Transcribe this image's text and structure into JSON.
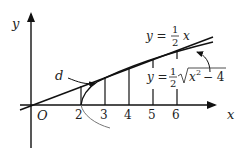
{
  "diagram": {
    "axes": {
      "x_label": "x",
      "y_label": "y",
      "origin_label": "O"
    },
    "ticks": [
      {
        "value": 2,
        "label": "2"
      },
      {
        "value": 3,
        "label": "3"
      },
      {
        "value": 4,
        "label": "4"
      },
      {
        "value": 5,
        "label": "5"
      },
      {
        "value": 6,
        "label": "6"
      }
    ],
    "line_label": {
      "lhs": "y =",
      "num": "1",
      "den": "2",
      "var": "x"
    },
    "curve_label": {
      "lhs": "y =",
      "num": "1",
      "den": "2",
      "radicand_x": "x",
      "radicand_exp": "2",
      "radicand_rest": "− 4"
    },
    "distance_label": "d",
    "colors": {
      "ink": "#111111",
      "curve": "#555555",
      "background": "#ffffff"
    }
  }
}
